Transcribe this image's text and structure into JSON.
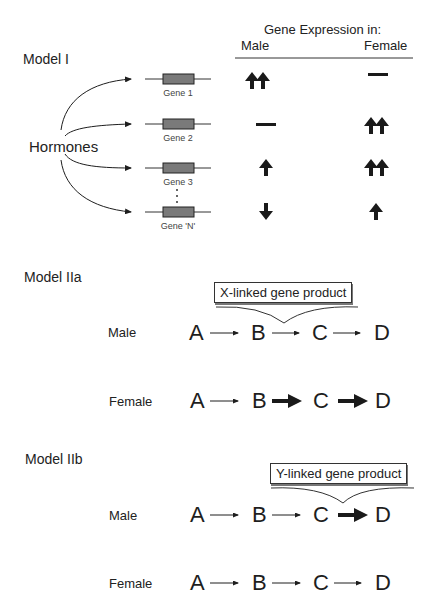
{
  "model1": {
    "title": "Model I",
    "header": "Gene Expression in:",
    "col_male": "Male",
    "col_female": "Female",
    "source": "Hormones",
    "genes": [
      {
        "label": "Gene 1",
        "male": "up-up",
        "female": "none"
      },
      {
        "label": "Gene 2",
        "male": "none",
        "female": "up-up"
      },
      {
        "label": "Gene 3",
        "male": "up",
        "female": "up-up"
      },
      {
        "label": "Gene 'N'",
        "male": "down",
        "female": "up"
      }
    ],
    "ellipsis": "⋮"
  },
  "model2a": {
    "title": "Model IIa",
    "box_label": "X-linked gene product",
    "rows": [
      {
        "sex": "Male",
        "nodes": [
          "A",
          "B",
          "C",
          "D"
        ],
        "arrows": [
          "thin",
          "thin",
          "thin"
        ]
      },
      {
        "sex": "Female",
        "nodes": [
          "A",
          "B",
          "C",
          "D"
        ],
        "arrows": [
          "thin",
          "bold",
          "bold"
        ]
      }
    ]
  },
  "model2b": {
    "title": "Model IIb",
    "box_label": "Y-linked gene product",
    "rows": [
      {
        "sex": "Male",
        "nodes": [
          "A",
          "B",
          "C",
          "D"
        ],
        "arrows": [
          "thin",
          "thin",
          "bold"
        ]
      },
      {
        "sex": "Female",
        "nodes": [
          "A",
          "B",
          "C",
          "D"
        ],
        "arrows": [
          "thin",
          "thin",
          "thin"
        ]
      }
    ]
  },
  "colors": {
    "ink": "#1e1e1e",
    "gene_box": "#7a7a7a"
  }
}
